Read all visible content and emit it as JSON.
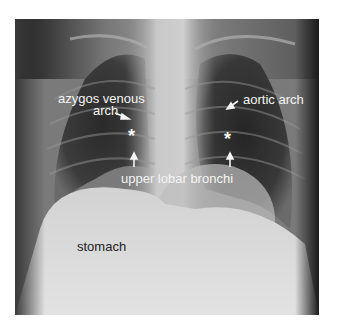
{
  "figure": {
    "type": "chest radiograph (PA view)",
    "annotations": [
      {
        "id": "azygos",
        "text_line1": "azygos venous",
        "text_line2": "arch"
      },
      {
        "id": "aortic",
        "text": "aortic arch"
      },
      {
        "id": "bronchi",
        "text": "upper lobar bronchi"
      },
      {
        "id": "stomach",
        "text": "stomach"
      }
    ],
    "markers": {
      "left": "*",
      "right": "*"
    },
    "colors": {
      "label_light": "#f4f4f4",
      "label_dark": "#222222",
      "background": "#ffffff"
    }
  }
}
